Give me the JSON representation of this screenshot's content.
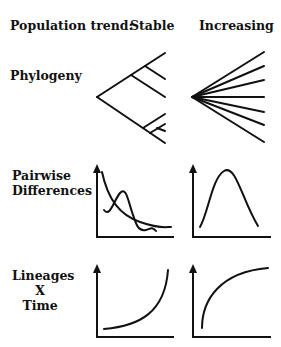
{
  "header": {
    "row_label": "Population trend:",
    "columns": [
      "Stable",
      "Increasing"
    ]
  },
  "rows": [
    {
      "label": "Phylogeny"
    },
    {
      "label_lines": [
        "Pairwise",
        "Differences"
      ]
    },
    {
      "label_lines": [
        "Lineages",
        "X",
        "Time"
      ]
    }
  ],
  "panels": {
    "phylogeny_stable": {
      "shape": "bifurcating tree with deep branches"
    },
    "phylogeny_increasing": {
      "shape": "star phylogeny",
      "branches": 7
    },
    "pairwise_stable": {
      "shape": "ragged multimodal distribution with decaying curve"
    },
    "pairwise_increasing": {
      "shape": "smooth unimodal (bell) distribution"
    },
    "ltt_stable": {
      "shape": "convex curve rising sharply at recent times"
    },
    "ltt_increasing": {
      "shape": "concave curve rising early and saturating"
    }
  },
  "colors": {
    "ink": "#111111",
    "background": "#ffffff"
  }
}
